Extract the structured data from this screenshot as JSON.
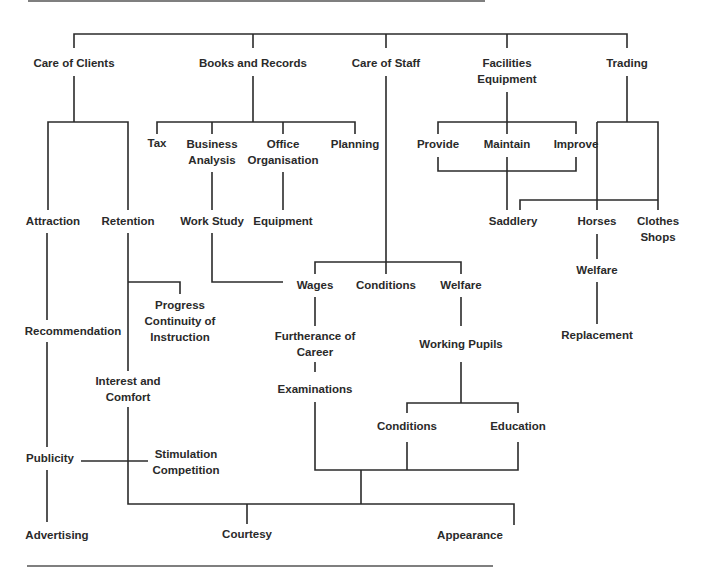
{
  "diagram": {
    "title": "",
    "nodes": {
      "care_of_clients": "Care of Clients",
      "books_and_records": "Books and Records",
      "care_of_staff": "Care of Staff",
      "facilities_equipment_1": "Facilities",
      "facilities_equipment_2": "Equipment",
      "trading": "Trading",
      "tax": "Tax",
      "business_analysis_1": "Business",
      "business_analysis_2": "Analysis",
      "office_organisation_1": "Office",
      "office_organisation_2": "Organisation",
      "planning": "Planning",
      "provide": "Provide",
      "maintain": "Maintain",
      "improve": "Improve",
      "attraction": "Attraction",
      "retention": "Retention",
      "work_study": "Work Study",
      "equipment": "Equipment",
      "saddlery": "Saddlery",
      "horses": "Horses",
      "clothes_shops_1": "Clothes",
      "clothes_shops_2": "Shops",
      "wages": "Wages",
      "conditions_staff": "Conditions",
      "welfare_staff": "Welfare",
      "horses_welfare": "Welfare",
      "progress_1": "Progress",
      "progress_2": "Continuity of",
      "progress_3": "Instruction",
      "recommendation": "Recommendation",
      "furtherance_1": "Furtherance of",
      "furtherance_2": "Career",
      "working_pupils": "Working Pupils",
      "replacement": "Replacement",
      "interest_1": "Interest and",
      "interest_2": "Comfort",
      "examinations": "Examinations",
      "conditions_pupils": "Conditions",
      "education": "Education",
      "publicity": "Publicity",
      "stimulation_1": "Stimulation",
      "stimulation_2": "Competition",
      "advertising": "Advertising",
      "courtesy": "Courtesy",
      "appearance": "Appearance"
    },
    "edges": [
      [
        "root",
        "Care of Clients"
      ],
      [
        "root",
        "Books and Records"
      ],
      [
        "root",
        "Care of Staff"
      ],
      [
        "root",
        "Facilities Equipment"
      ],
      [
        "root",
        "Trading"
      ],
      [
        "Care of Clients",
        "Attraction"
      ],
      [
        "Care of Clients",
        "Retention"
      ],
      [
        "Books and Records",
        "Tax"
      ],
      [
        "Books and Records",
        "Business Analysis"
      ],
      [
        "Books and Records",
        "Office Organisation"
      ],
      [
        "Books and Records",
        "Planning"
      ],
      [
        "Business Analysis",
        "Work Study"
      ],
      [
        "Office Organisation",
        "Equipment"
      ],
      [
        "Facilities Equipment",
        "Provide"
      ],
      [
        "Facilities Equipment",
        "Maintain"
      ],
      [
        "Facilities Equipment",
        "Improve"
      ],
      [
        "Provide/Maintain/Improve",
        "Saddlery"
      ],
      [
        "Trading",
        "Saddlery"
      ],
      [
        "Trading",
        "Horses"
      ],
      [
        "Trading",
        "Clothes Shops"
      ],
      [
        "Horses",
        "Welfare"
      ],
      [
        "Welfare",
        "Replacement"
      ],
      [
        "Care of Staff",
        "Wages"
      ],
      [
        "Care of Staff",
        "Conditions"
      ],
      [
        "Care of Staff",
        "Welfare"
      ],
      [
        "Work Study",
        "Wages"
      ],
      [
        "Wages",
        "Furtherance of Career"
      ],
      [
        "Furtherance of Career",
        "Examinations"
      ],
      [
        "Welfare",
        "Working Pupils"
      ],
      [
        "Working Pupils",
        "Conditions"
      ],
      [
        "Working Pupils",
        "Education"
      ],
      [
        "Retention",
        "Progress Continuity of Instruction"
      ],
      [
        "Retention",
        "Interest and Comfort"
      ],
      [
        "Attraction",
        "Recommendation"
      ],
      [
        "Recommendation",
        "Publicity"
      ],
      [
        "Publicity",
        "Advertising"
      ],
      [
        "Publicity",
        "Stimulation Competition"
      ],
      [
        "Examinations/Conditions/Education",
        "Courtesy/Appearance"
      ],
      [
        "Interest and Comfort",
        "Courtesy"
      ],
      [
        "Interest and Comfort",
        "Appearance"
      ]
    ]
  }
}
